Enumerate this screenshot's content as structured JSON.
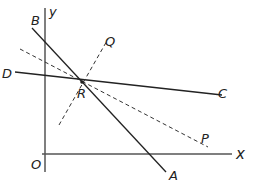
{
  "diagram": {
    "axes": {
      "x_label": "x",
      "y_label": "y",
      "origin_label": "O"
    },
    "points": {
      "A": "A",
      "B": "B",
      "C": "C",
      "D": "D",
      "P": "P",
      "Q": "Q",
      "R": "R"
    },
    "lines": [
      {
        "name": "AB",
        "style": "solid",
        "from": "B",
        "to": "A"
      },
      {
        "name": "DC",
        "style": "solid",
        "from": "D",
        "to": "C"
      },
      {
        "name": "RP",
        "style": "dashed",
        "through": "R",
        "to": "P"
      },
      {
        "name": "RQ",
        "style": "dashed",
        "through": "R",
        "to": "Q"
      }
    ],
    "intersection": "R"
  }
}
